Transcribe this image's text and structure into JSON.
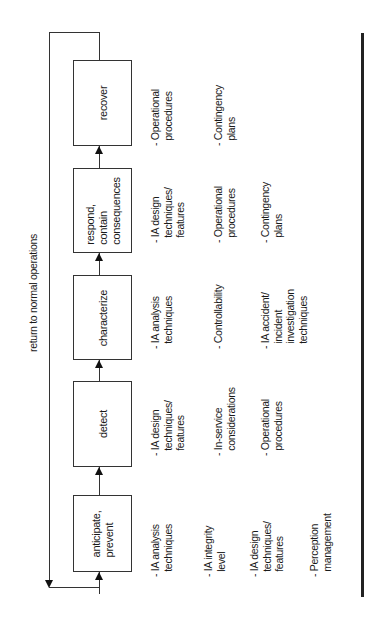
{
  "diagram": {
    "feedback_label": "return to normal operations",
    "stages": [
      {
        "id": "recover",
        "label": "recover",
        "items": [
          "- Operational\n  procedures",
          "- Contingency\n  plans"
        ]
      },
      {
        "id": "respond",
        "label": "respond,\ncontain\nconsequences",
        "items": [
          "- IA design\n  techniques/\n  features",
          "- Operational\n  procedures",
          "- Contingency\n  plans"
        ]
      },
      {
        "id": "characterize",
        "label": "characterize",
        "items": [
          "- IA analysis\n  techniques",
          "- Controllability",
          "- IA accident/\n  incident\n  investigation\n  techniques"
        ]
      },
      {
        "id": "detect",
        "label": "detect",
        "items": [
          "- IA design\n  techniques/\n  features",
          "- In-service\n  considerations",
          "- Operational\n  procedures"
        ]
      },
      {
        "id": "anticipate",
        "label": "anticipate,\nprevent",
        "items": [
          "- IA analysis\n  techniques",
          "- IA integrity\n  level",
          "- IA design\n  techniques/\n  features",
          "- Perception\n  management"
        ]
      }
    ],
    "colors": {
      "line": "#333333",
      "rail": "#222222",
      "background": "#ffffff"
    }
  }
}
